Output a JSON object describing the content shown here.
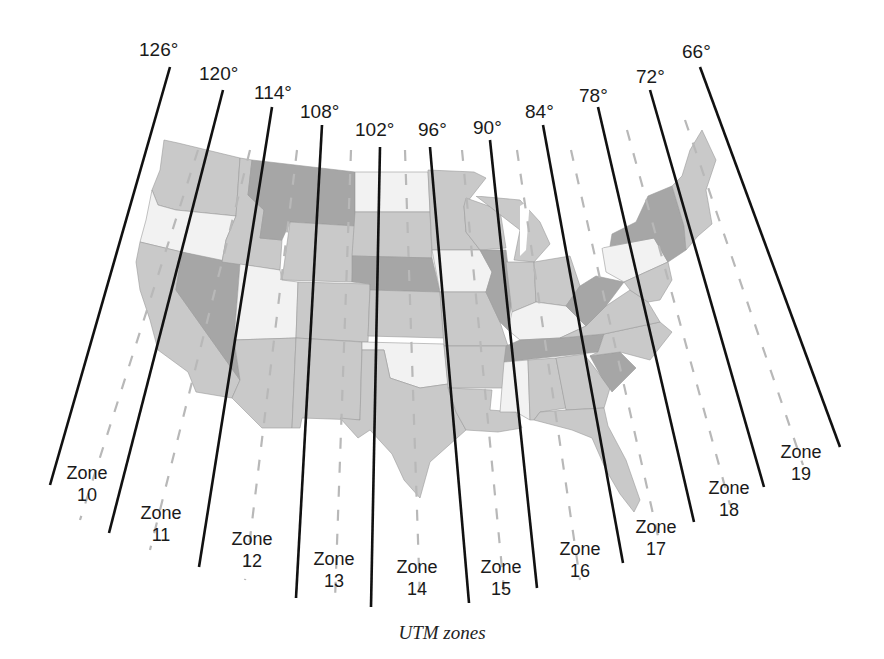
{
  "title": "UTM zones",
  "map": {
    "region": "Contiguous United States",
    "fill_colors": {
      "light": "#f2f2f2",
      "medium": "#c9c9c9",
      "dark": "#a6a6a6",
      "water": "#ffffff"
    },
    "meridians": [
      {
        "label": "126°",
        "top": [
          170,
          67
        ],
        "bottom": [
          50,
          485
        ],
        "label_pos": [
          139,
          56
        ]
      },
      {
        "label": "120°",
        "top": [
          223,
          90
        ],
        "bottom": [
          109,
          533
        ],
        "label_pos": [
          199,
          80
        ]
      },
      {
        "label": "114°",
        "top": [
          272,
          107
        ],
        "bottom": [
          199,
          567
        ],
        "label_pos": [
          254,
          99
        ]
      },
      {
        "label": "108°",
        "top": [
          322,
          125
        ],
        "bottom": [
          296,
          598
        ],
        "label_pos": [
          300,
          118
        ]
      },
      {
        "label": "102°",
        "top": [
          380,
          147
        ],
        "bottom": [
          371,
          607
        ],
        "label_pos": [
          355,
          136
        ]
      },
      {
        "label": "96°",
        "top": [
          430,
          147
        ],
        "bottom": [
          469,
          603
        ],
        "label_pos": [
          418,
          136
        ]
      },
      {
        "label": "90°",
        "top": [
          490,
          140
        ],
        "bottom": [
          537,
          588
        ],
        "label_pos": [
          473,
          134
        ]
      },
      {
        "label": "84°",
        "top": [
          543,
          125
        ],
        "bottom": [
          623,
          563
        ],
        "label_pos": [
          525,
          118
        ]
      },
      {
        "label": "78°",
        "top": [
          598,
          107
        ],
        "bottom": [
          694,
          522
        ],
        "label_pos": [
          579,
          102
        ]
      },
      {
        "label": "72°",
        "top": [
          650,
          90
        ],
        "bottom": [
          764,
          487
        ],
        "label_pos": [
          636,
          83
        ]
      },
      {
        "label": "66°",
        "top": [
          700,
          67
        ],
        "bottom": [
          840,
          447
        ],
        "label_pos": [
          682,
          58
        ]
      }
    ],
    "zones": [
      {
        "name": "Zone",
        "number": "10",
        "pos": [
          87,
          479
        ]
      },
      {
        "name": "Zone",
        "number": "11",
        "pos": [
          161,
          519
        ]
      },
      {
        "name": "Zone",
        "number": "12",
        "pos": [
          252,
          545
        ]
      },
      {
        "name": "Zone",
        "number": "13",
        "pos": [
          334,
          565
        ]
      },
      {
        "name": "Zone",
        "number": "14",
        "pos": [
          417,
          573
        ]
      },
      {
        "name": "Zone",
        "number": "15",
        "pos": [
          501,
          573
        ]
      },
      {
        "name": "Zone",
        "number": "16",
        "pos": [
          580,
          555
        ]
      },
      {
        "name": "Zone",
        "number": "17",
        "pos": [
          656,
          533
        ]
      },
      {
        "name": "Zone",
        "number": "18",
        "pos": [
          729,
          494
        ]
      },
      {
        "name": "Zone",
        "number": "19",
        "pos": [
          801,
          458
        ]
      }
    ],
    "central_meridians": [
      {
        "top": [
          198,
          150
        ],
        "bottom": [
          80,
          520
        ]
      },
      {
        "top": [
          250,
          150
        ],
        "bottom": [
          150,
          550
        ]
      },
      {
        "top": [
          297,
          150
        ],
        "bottom": [
          245,
          580
        ]
      },
      {
        "top": [
          351,
          150
        ],
        "bottom": [
          335,
          600
        ]
      },
      {
        "top": [
          405,
          150
        ],
        "bottom": [
          420,
          600
        ]
      },
      {
        "top": [
          462,
          150
        ],
        "bottom": [
          505,
          600
        ]
      },
      {
        "top": [
          517,
          150
        ],
        "bottom": [
          580,
          580
        ]
      },
      {
        "top": [
          571,
          150
        ],
        "bottom": [
          660,
          545
        ]
      },
      {
        "top": [
          627,
          130
        ],
        "bottom": [
          730,
          505
        ]
      },
      {
        "top": [
          685,
          120
        ],
        "bottom": [
          803,
          465
        ]
      }
    ]
  }
}
